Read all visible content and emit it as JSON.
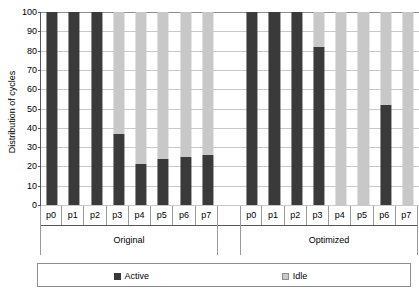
{
  "chart_data": {
    "type": "bar",
    "subtype": "stacked-bar-100",
    "title": "",
    "xlabel": "",
    "ylabel": "Distribution of cycles",
    "ylim": [
      0,
      100
    ],
    "yticks": [
      0,
      10,
      20,
      30,
      40,
      50,
      60,
      70,
      80,
      90,
      100
    ],
    "grid": true,
    "legend_position": "bottom",
    "groups": [
      "Original",
      "Optimized"
    ],
    "categories": [
      "p0",
      "p1",
      "p2",
      "p3",
      "p4",
      "p5",
      "p6",
      "p7"
    ],
    "series": [
      {
        "name": "Active",
        "color": "#3a3a3a",
        "values_by_group": {
          "Original": [
            100,
            100,
            100,
            37,
            21,
            24,
            25,
            26
          ],
          "Optimized": [
            100,
            100,
            100,
            82,
            0,
            0,
            52,
            0
          ]
        }
      },
      {
        "name": "Idle",
        "color": "#c8c8c8",
        "values_by_group": {
          "Original": [
            0,
            0,
            0,
            63,
            79,
            76,
            75,
            74
          ],
          "Optimized": [
            0,
            0,
            0,
            18,
            100,
            100,
            48,
            100
          ]
        }
      }
    ]
  },
  "axis": {
    "y_title": "Distribution of cycles",
    "y_tick_labels": [
      "100",
      "90",
      "80",
      "70",
      "60",
      "50",
      "40",
      "30",
      "20",
      "10",
      "0"
    ]
  },
  "groups": [
    {
      "label": "Original",
      "categories": [
        "p0",
        "p1",
        "p2",
        "p3",
        "p4",
        "p5",
        "p6",
        "p7"
      ]
    },
    {
      "label": "Optimized",
      "categories": [
        "p0",
        "p1",
        "p2",
        "p3",
        "p4",
        "p5",
        "p6",
        "p7"
      ]
    }
  ],
  "legend": {
    "items": [
      {
        "label": "Active",
        "color": "#3a3a3a"
      },
      {
        "label": "Idle",
        "color": "#c8c8c8"
      }
    ]
  }
}
